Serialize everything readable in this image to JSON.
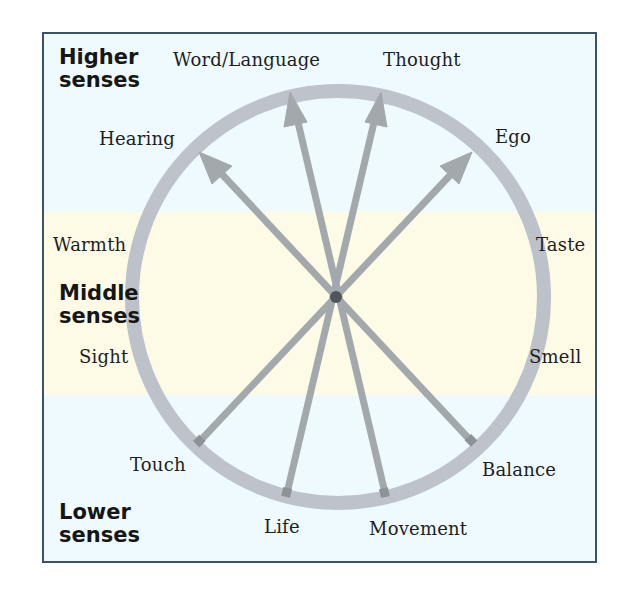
{
  "diagram": {
    "type": "radial-senses-wheel",
    "center": {
      "x": 338,
      "y": 297
    },
    "ring": {
      "radius": 206,
      "width": 14,
      "color": "#b9bfc8"
    },
    "spoke_color": "#a3a8ad",
    "hub_color": "#505558",
    "colors": {
      "frame_border": "#3a5368",
      "higher_lower_background": "#eefafd",
      "middle_background": "#fdfbe6"
    }
  },
  "groups": {
    "higher": {
      "line1": "Higher",
      "line2": "senses"
    },
    "middle": {
      "line1": "Middle",
      "line2": "senses"
    },
    "lower": {
      "line1": "Lower",
      "line2": "senses"
    }
  },
  "senses": {
    "word_language": "Word/Language",
    "thought": "Thought",
    "hearing": "Hearing",
    "ego": "Ego",
    "warmth": "Warmth",
    "taste": "Taste",
    "sight": "Sight",
    "smell": "Smell",
    "touch": "Touch",
    "balance": "Balance",
    "life": "Life",
    "movement": "Movement"
  },
  "axes": [
    {
      "from": "Touch",
      "to": "Ego"
    },
    {
      "from": "Life",
      "to": "Thought"
    },
    {
      "from": "Movement",
      "to": "Word/Language"
    },
    {
      "from": "Balance",
      "to": "Hearing"
    }
  ]
}
